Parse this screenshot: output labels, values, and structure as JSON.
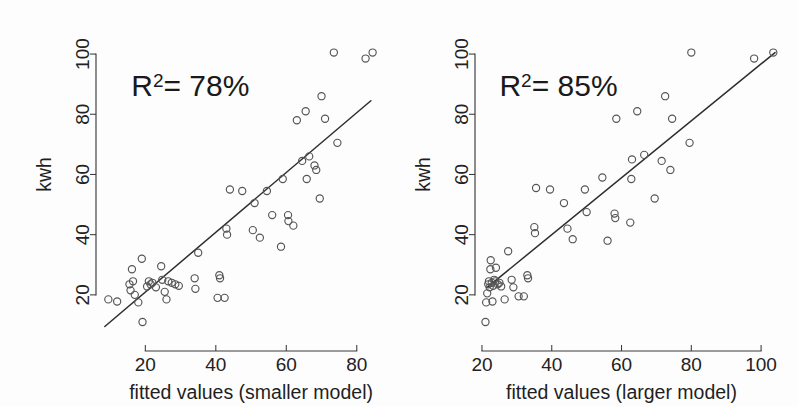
{
  "figure": {
    "background_color": "#fdfdfd",
    "ink_color": "#2e2e2e",
    "point_color": "#555555",
    "panel_count": 2
  },
  "chart_data": [
    {
      "type": "scatter",
      "panel": "left",
      "title": "",
      "xlabel": "fitted values (smaller model)",
      "ylabel": "kwh",
      "xlim": [
        6,
        90
      ],
      "ylim": [
        6,
        106
      ],
      "xticks": [
        20,
        40,
        60,
        80
      ],
      "xtick_labels": [
        "20",
        "40",
        "60",
        "80"
      ],
      "yticks": [
        20,
        40,
        60,
        80,
        100
      ],
      "ytick_labels": [
        "20",
        "40",
        "60",
        "80",
        "100"
      ],
      "grid": false,
      "legend": false,
      "annotations": [
        {
          "text": "R2= 78%",
          "base": "R",
          "superscript": "2",
          "rest": "= 78%",
          "x": 16,
          "y": 86
        }
      ],
      "fit_line": {
        "type": "line",
        "x": [
          8.5,
          84.0
        ],
        "y": [
          9.5,
          84.5
        ]
      },
      "marker": "open-circle",
      "points": [
        {
          "x": 9.5,
          "y": 18.5
        },
        {
          "x": 12.0,
          "y": 17.8
        },
        {
          "x": 15.5,
          "y": 23.5
        },
        {
          "x": 15.8,
          "y": 21.5
        },
        {
          "x": 16.2,
          "y": 28.5
        },
        {
          "x": 16.5,
          "y": 24.5
        },
        {
          "x": 17.0,
          "y": 20.0
        },
        {
          "x": 18.0,
          "y": 17.5
        },
        {
          "x": 19.0,
          "y": 32.0
        },
        {
          "x": 19.2,
          "y": 11.0
        },
        {
          "x": 20.5,
          "y": 22.8
        },
        {
          "x": 21.0,
          "y": 24.5
        },
        {
          "x": 21.5,
          "y": 23.5
        },
        {
          "x": 22.0,
          "y": 24.0
        },
        {
          "x": 23.0,
          "y": 22.5
        },
        {
          "x": 24.5,
          "y": 29.5
        },
        {
          "x": 24.8,
          "y": 25.0
        },
        {
          "x": 25.5,
          "y": 21.0
        },
        {
          "x": 26.0,
          "y": 18.5
        },
        {
          "x": 26.5,
          "y": 24.5
        },
        {
          "x": 27.5,
          "y": 24.0
        },
        {
          "x": 28.5,
          "y": 23.5
        },
        {
          "x": 29.5,
          "y": 23.0
        },
        {
          "x": 34.0,
          "y": 25.5
        },
        {
          "x": 34.2,
          "y": 22.0
        },
        {
          "x": 35.0,
          "y": 34.0
        },
        {
          "x": 40.5,
          "y": 19.0
        },
        {
          "x": 41.0,
          "y": 26.5
        },
        {
          "x": 41.2,
          "y": 25.5
        },
        {
          "x": 42.5,
          "y": 19.0
        },
        {
          "x": 43.0,
          "y": 42.0
        },
        {
          "x": 43.2,
          "y": 40.0
        },
        {
          "x": 44.0,
          "y": 55.0
        },
        {
          "x": 47.5,
          "y": 54.5
        },
        {
          "x": 50.5,
          "y": 41.5
        },
        {
          "x": 51.0,
          "y": 50.5
        },
        {
          "x": 52.5,
          "y": 39.0
        },
        {
          "x": 54.5,
          "y": 54.5
        },
        {
          "x": 56.0,
          "y": 46.5
        },
        {
          "x": 58.5,
          "y": 36.0
        },
        {
          "x": 59.0,
          "y": 58.5
        },
        {
          "x": 60.5,
          "y": 46.5
        },
        {
          "x": 60.6,
          "y": 44.5
        },
        {
          "x": 62.0,
          "y": 43.0
        },
        {
          "x": 63.0,
          "y": 78.0
        },
        {
          "x": 64.5,
          "y": 64.5
        },
        {
          "x": 65.5,
          "y": 81.0
        },
        {
          "x": 65.8,
          "y": 58.5
        },
        {
          "x": 66.5,
          "y": 66.0
        },
        {
          "x": 68.0,
          "y": 63.0
        },
        {
          "x": 68.5,
          "y": 61.5
        },
        {
          "x": 69.5,
          "y": 52.0
        },
        {
          "x": 70.0,
          "y": 86.0
        },
        {
          "x": 71.0,
          "y": 78.5
        },
        {
          "x": 73.5,
          "y": 100.5
        },
        {
          "x": 74.5,
          "y": 70.5
        },
        {
          "x": 82.5,
          "y": 98.5
        },
        {
          "x": 84.5,
          "y": 100.5
        }
      ]
    },
    {
      "type": "scatter",
      "panel": "right",
      "title": "",
      "xlabel": "fitted values (larger model)",
      "ylabel": "kwh",
      "xlim": [
        18,
        108
      ],
      "ylim": [
        6,
        106
      ],
      "xticks": [
        20,
        40,
        60,
        80,
        100
      ],
      "xtick_labels": [
        "20",
        "40",
        "60",
        "80",
        "100"
      ],
      "yticks": [
        20,
        40,
        60,
        80,
        100
      ],
      "ytick_labels": [
        "20",
        "40",
        "60",
        "80",
        "100"
      ],
      "grid": false,
      "legend": false,
      "annotations": [
        {
          "text": "R2= 85%",
          "base": "R",
          "superscript": "2",
          "rest": "= 85%",
          "x": 25,
          "y": 86
        }
      ],
      "fit_line": {
        "type": "line",
        "x": [
          21.5,
          104.0
        ],
        "y": [
          22.5,
          100.5
        ]
      },
      "marker": "open-circle",
      "points": [
        {
          "x": 21.0,
          "y": 11.0
        },
        {
          "x": 21.2,
          "y": 17.5
        },
        {
          "x": 21.5,
          "y": 20.5
        },
        {
          "x": 21.8,
          "y": 23.5
        },
        {
          "x": 22.0,
          "y": 24.5
        },
        {
          "x": 22.2,
          "y": 22.5
        },
        {
          "x": 22.4,
          "y": 28.5
        },
        {
          "x": 22.5,
          "y": 31.5
        },
        {
          "x": 22.8,
          "y": 24.0
        },
        {
          "x": 23.0,
          "y": 17.8
        },
        {
          "x": 23.2,
          "y": 23.0
        },
        {
          "x": 23.5,
          "y": 25.0
        },
        {
          "x": 23.8,
          "y": 24.5
        },
        {
          "x": 24.0,
          "y": 29.0
        },
        {
          "x": 24.5,
          "y": 23.5
        },
        {
          "x": 25.0,
          "y": 24.0
        },
        {
          "x": 25.5,
          "y": 22.8
        },
        {
          "x": 26.5,
          "y": 18.5
        },
        {
          "x": 27.5,
          "y": 34.5
        },
        {
          "x": 28.5,
          "y": 25.0
        },
        {
          "x": 29.0,
          "y": 22.5
        },
        {
          "x": 30.5,
          "y": 19.5
        },
        {
          "x": 32.0,
          "y": 19.5
        },
        {
          "x": 33.0,
          "y": 26.5
        },
        {
          "x": 33.2,
          "y": 25.5
        },
        {
          "x": 35.0,
          "y": 42.5
        },
        {
          "x": 35.2,
          "y": 40.5
        },
        {
          "x": 35.5,
          "y": 55.5
        },
        {
          "x": 39.5,
          "y": 55.0
        },
        {
          "x": 43.5,
          "y": 50.5
        },
        {
          "x": 44.5,
          "y": 42.0
        },
        {
          "x": 46.0,
          "y": 38.5
        },
        {
          "x": 49.5,
          "y": 55.0
        },
        {
          "x": 50.0,
          "y": 47.5
        },
        {
          "x": 54.5,
          "y": 59.0
        },
        {
          "x": 56.0,
          "y": 38.0
        },
        {
          "x": 58.0,
          "y": 47.0
        },
        {
          "x": 58.2,
          "y": 45.5
        },
        {
          "x": 58.5,
          "y": 78.5
        },
        {
          "x": 62.5,
          "y": 44.0
        },
        {
          "x": 62.8,
          "y": 58.5
        },
        {
          "x": 63.0,
          "y": 65.0
        },
        {
          "x": 64.5,
          "y": 81.0
        },
        {
          "x": 66.5,
          "y": 66.5
        },
        {
          "x": 69.5,
          "y": 52.0
        },
        {
          "x": 71.5,
          "y": 64.5
        },
        {
          "x": 72.5,
          "y": 86.0
        },
        {
          "x": 74.0,
          "y": 61.5
        },
        {
          "x": 74.5,
          "y": 78.5
        },
        {
          "x": 79.5,
          "y": 70.5
        },
        {
          "x": 80.0,
          "y": 100.5
        },
        {
          "x": 98.0,
          "y": 98.5
        },
        {
          "x": 103.5,
          "y": 100.5
        }
      ]
    }
  ]
}
